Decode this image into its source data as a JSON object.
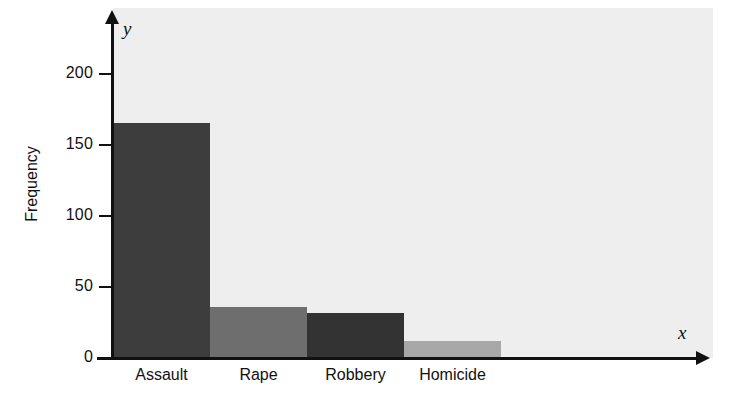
{
  "chart_data": {
    "type": "bar",
    "title": "",
    "subtitle": "",
    "xlabel": "",
    "ylabel": "Frequency",
    "x_axis_letter": "x",
    "y_axis_letter": "y",
    "categories": [
      "Assault",
      "Rape",
      "Robbery",
      "Homicide"
    ],
    "values": [
      166,
      36,
      32,
      12
    ],
    "series": [
      {
        "name": "Frequency",
        "values": [
          166,
          36,
          32,
          12
        ]
      }
    ],
    "bar_colors": [
      "#3d3d3d",
      "#6e6e6e",
      "#333333",
      "#a8a8a8"
    ],
    "ylim": [
      0,
      215
    ],
    "y_ticks": [
      0,
      50,
      100,
      150,
      200
    ],
    "y_tick_labels": [
      "0",
      "50",
      "100",
      "150",
      "200"
    ],
    "grid": false,
    "legend": false,
    "legend_position": "none",
    "plot_background": "#eeeeee",
    "axis_color": "#111111",
    "bars_adjacent": true
  }
}
